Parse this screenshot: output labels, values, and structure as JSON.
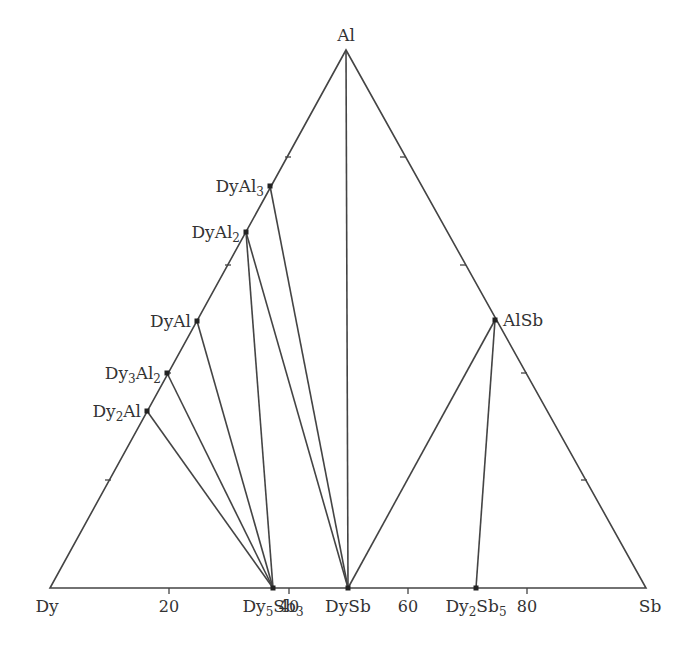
{
  "diagram": {
    "line_color": "#444444",
    "vertices": {
      "top": {
        "label": "Al",
        "x": 346,
        "y": 50
      },
      "left": {
        "label": "Dy",
        "x": 50,
        "y": 588
      },
      "right": {
        "label": "Sb",
        "x": 646,
        "y": 588
      }
    },
    "axis_ticks": [
      {
        "label": "20",
        "x": 169
      },
      {
        "label": "40",
        "x": 289
      },
      {
        "label": "60",
        "x": 408
      },
      {
        "label": "80",
        "x": 527
      }
    ],
    "compounds": [
      {
        "id": "DyAl3",
        "base": "DyAl",
        "sub": "3",
        "x": 270,
        "y": 186,
        "side": "left"
      },
      {
        "id": "DyAl2",
        "base": "DyAl",
        "sub": "2",
        "x": 246,
        "y": 232,
        "side": "left"
      },
      {
        "id": "DyAl",
        "base": "DyAl",
        "sub": "",
        "x": 197,
        "y": 321,
        "side": "left"
      },
      {
        "id": "Dy3Al2",
        "pre": "Dy",
        "presub": "3",
        "base": "Al",
        "sub": "2",
        "x": 167,
        "y": 373,
        "side": "left"
      },
      {
        "id": "Dy2Al",
        "pre": "Dy",
        "presub": "2",
        "base": "Al",
        "sub": "",
        "x": 147,
        "y": 411,
        "side": "left"
      },
      {
        "id": "AlSb",
        "base": "AlSb",
        "sub": "",
        "x": 495,
        "y": 320,
        "side": "right"
      },
      {
        "id": "Dy5Sb3",
        "pre": "Dy",
        "presub": "5",
        "base": "Sb",
        "sub": "3",
        "x": 273,
        "y": 588,
        "side": "bottom"
      },
      {
        "id": "DySb",
        "base": "DySb",
        "sub": "",
        "x": 348,
        "y": 588,
        "side": "bottom"
      },
      {
        "id": "Dy2Sb5",
        "pre": "Dy",
        "presub": "2",
        "base": "Sb",
        "sub": "5",
        "x": 476,
        "y": 588,
        "side": "bottom"
      }
    ],
    "tie_lines": [
      [
        "Dy2Al",
        "Dy5Sb3"
      ],
      [
        "Dy3Al2",
        "Dy5Sb3"
      ],
      [
        "DyAl",
        "Dy5Sb3"
      ],
      [
        "DyAl2",
        "Dy5Sb3"
      ],
      [
        "DyAl2",
        "DySb"
      ],
      [
        "DyAl3",
        "DySb"
      ],
      [
        "Al",
        "DySb"
      ],
      [
        "AlSb",
        "DySb"
      ],
      [
        "AlSb",
        "Dy2Sb5"
      ]
    ],
    "left_edge_ticks": [
      [
        285,
        157
      ],
      [
        225,
        265
      ],
      [
        165,
        373
      ],
      [
        105,
        480
      ]
    ],
    "right_edge_ticks": [
      [
        406,
        157
      ],
      [
        466,
        265
      ],
      [
        527,
        373
      ],
      [
        587,
        480
      ]
    ]
  }
}
